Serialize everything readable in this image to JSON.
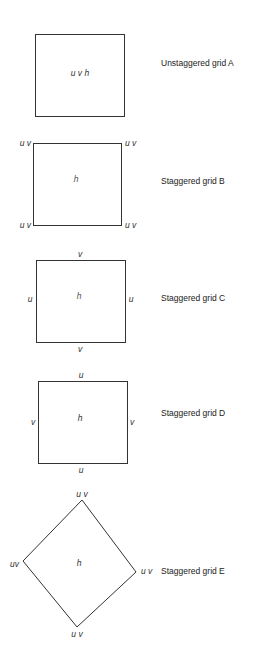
{
  "diagrams": [
    {
      "caption": "Unstaggered grid A",
      "center_label": "u v h"
    },
    {
      "caption": "Staggered grid B",
      "center_label": "h",
      "corner_labels": {
        "top_left": "u v",
        "top_right": "u v",
        "bottom_left": "u v",
        "bottom_right": "u v"
      }
    },
    {
      "caption": "Staggered grid C",
      "center_label": "h",
      "edge_labels": {
        "top": "v",
        "bottom": "v",
        "left": "u",
        "right": "u"
      }
    },
    {
      "caption": "Staggered grid D",
      "center_label": "h",
      "edge_labels": {
        "top": "u",
        "bottom": "u",
        "left": "v",
        "right": "v"
      }
    },
    {
      "caption": "Staggered grid E",
      "center_label": "h",
      "vertex_labels": {
        "top": "u v",
        "left": "uv",
        "right": "u v",
        "bottom": "u v"
      }
    }
  ]
}
